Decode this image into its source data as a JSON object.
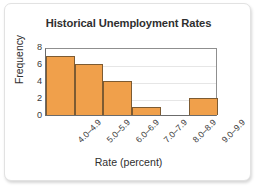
{
  "card": {
    "background": "#ffffff",
    "border_color": "#e2e2e2"
  },
  "chart_data": {
    "type": "bar",
    "title": "Historical Unemployment Rates",
    "xlabel": "Rate (percent)",
    "ylabel": "Frequency",
    "categories": [
      "4.0–4.9",
      "5.0–5.9",
      "6.0–6.9",
      "7.0–7.9",
      "8.0–8.9",
      "9.0–9.9"
    ],
    "values": [
      7,
      6,
      4,
      1,
      0,
      2
    ],
    "ylim": [
      0,
      8
    ],
    "yticks": [
      0,
      2,
      4,
      6,
      8
    ],
    "ytick_labels": [
      "0",
      "2",
      "4",
      "6",
      "8"
    ],
    "grid": true,
    "grid_axis": "y",
    "legend": false,
    "bar_color": "#f0a04b",
    "bar_border_color": "#7d5b32",
    "gridline_color": "#e6e6e6",
    "axis_color": "#6b6b6b",
    "text_color": "#2f2f2f",
    "xtick_rotation": -45
  }
}
